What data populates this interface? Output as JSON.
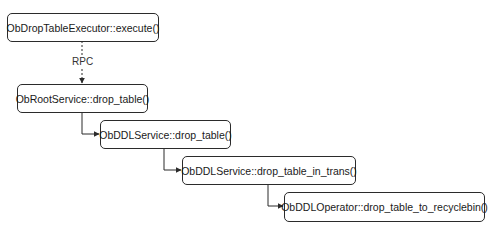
{
  "diagram": {
    "type": "call-flow",
    "nodes": [
      {
        "id": "n1",
        "label": "ObDropTableExecutor::execute()"
      },
      {
        "id": "n2",
        "label": "ObRootService::drop_table()"
      },
      {
        "id": "n3",
        "label": "ObDDLService::drop_table()"
      },
      {
        "id": "n4",
        "label": "ObDDLService::drop_table_in_trans()"
      },
      {
        "id": "n5",
        "label": "ObDDLOperator::drop_table_to_recyclebin()"
      }
    ],
    "edges": [
      {
        "from": "n1",
        "to": "n2",
        "label": "RPC",
        "style": "dashed"
      },
      {
        "from": "n2",
        "to": "n3",
        "label": "",
        "style": "solid"
      },
      {
        "from": "n3",
        "to": "n4",
        "label": "",
        "style": "solid"
      },
      {
        "from": "n4",
        "to": "n5",
        "label": "",
        "style": "solid"
      }
    ],
    "colors": {
      "stroke": "#2b2b2b",
      "text": "#1a1a1a",
      "background": "#ffffff"
    }
  }
}
